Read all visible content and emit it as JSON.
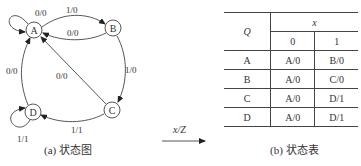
{
  "state_diagram": {
    "caption": "(a) 状态图",
    "states": [
      {
        "id": "A",
        "label": "A",
        "cx": 34,
        "cy": 30
      },
      {
        "id": "B",
        "label": "B",
        "cx": 113,
        "cy": 28
      },
      {
        "id": "C",
        "label": "C",
        "cx": 112,
        "cy": 110
      },
      {
        "id": "D",
        "label": "D",
        "cx": 33,
        "cy": 112
      }
    ],
    "transitions": [
      {
        "from": "A",
        "to": "A",
        "label": "0/0"
      },
      {
        "from": "A",
        "to": "B",
        "label": "1/0"
      },
      {
        "from": "B",
        "to": "A",
        "label": "0/0"
      },
      {
        "from": "B",
        "to": "C",
        "label": "1/0"
      },
      {
        "from": "C",
        "to": "A",
        "label": "0/0"
      },
      {
        "from": "C",
        "to": "D",
        "label": "1/1"
      },
      {
        "from": "D",
        "to": "A",
        "label": "0/0"
      },
      {
        "from": "D",
        "to": "D",
        "label": "1/1"
      }
    ]
  },
  "io_arrow": {
    "label": "x/Z"
  },
  "state_table": {
    "caption": "(b) 状态表",
    "row_header": "Q",
    "col_header": "x",
    "columns": [
      "0",
      "1"
    ],
    "rows": [
      {
        "state": "A",
        "cells": [
          "A/0",
          "B/0"
        ]
      },
      {
        "state": "B",
        "cells": [
          "A/0",
          "C/0"
        ]
      },
      {
        "state": "C",
        "cells": [
          "A/0",
          "D/1"
        ]
      },
      {
        "state": "D",
        "cells": [
          "A/0",
          "D/1"
        ]
      }
    ]
  }
}
